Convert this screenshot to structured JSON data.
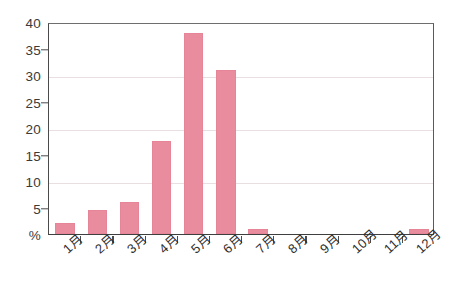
{
  "chart_data": {
    "type": "bar",
    "title": "",
    "subtitle": "",
    "xlabel": "",
    "ylabel": "%",
    "categories": [
      "1月",
      "2月",
      "3月",
      "4月",
      "5月",
      "6月",
      "7月",
      "8月",
      "9月",
      "10月",
      "11月",
      "12月"
    ],
    "values": [
      2,
      4.5,
      6,
      17.5,
      38,
      31,
      1,
      0,
      0,
      0,
      0,
      1
    ],
    "ylim": [
      0,
      40
    ],
    "ytick_labels": [
      "40",
      "35",
      "30",
      "25",
      "20",
      "15",
      "10",
      "5",
      "%"
    ],
    "ytick_values": [
      40,
      35,
      30,
      25,
      20,
      15,
      10,
      5,
      0
    ],
    "gridline_values": [
      30,
      20,
      10
    ],
    "grid": true,
    "legend": null,
    "legend_position": "none",
    "series": [
      {
        "name": "",
        "color": "#e98c9d",
        "values": [
          2,
          4.5,
          6,
          17.5,
          38,
          31,
          1,
          0,
          0,
          0,
          0,
          1
        ]
      }
    ]
  },
  "axis": {
    "zero_label": "%",
    "tick_color": "#4a4a4a",
    "grid_color": "#e9dfe1",
    "frame_color": "#4a4a4a"
  }
}
